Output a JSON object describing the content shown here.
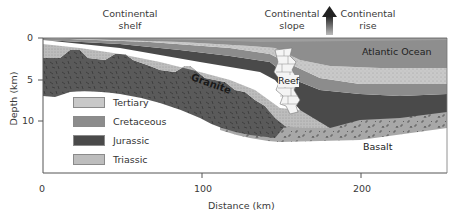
{
  "labels": {
    "continental_shelf": [
      "Continental",
      "shelf"
    ],
    "continental_slope": [
      "Continental",
      "slope"
    ],
    "continental_rise": [
      "Continental",
      "rise"
    ],
    "atlantic_ocean": "Atlantic Ocean",
    "reef": "Reef",
    "granite": "Granite",
    "basalt": "Basalt"
  },
  "axes": {
    "y_title": "Depth (km)",
    "y_ticks": [
      "0",
      "5",
      "10"
    ],
    "x_title": "Distance (km)",
    "x_ticks": [
      "0",
      "100",
      "200"
    ]
  },
  "legend": [
    {
      "label": "Tertiary",
      "color": "#c8c8c8"
    },
    {
      "label": "Cretaceous",
      "color": "#8c8c8c"
    },
    {
      "label": "Jurassic",
      "color": "#4a4a4a"
    },
    {
      "label": "Triassic",
      "color": "#bdbdbd"
    }
  ],
  "colors": {
    "ocean": "#8e8e8e",
    "tertiary": "#c8c8c8",
    "cretaceous": "#8c8c8c",
    "jurassic": "#4a4a4a",
    "triassic": "#bdbdbd",
    "granite": "#5a5a5a",
    "basalt": "#a8a8a8",
    "reef": "#f2f2f2"
  }
}
